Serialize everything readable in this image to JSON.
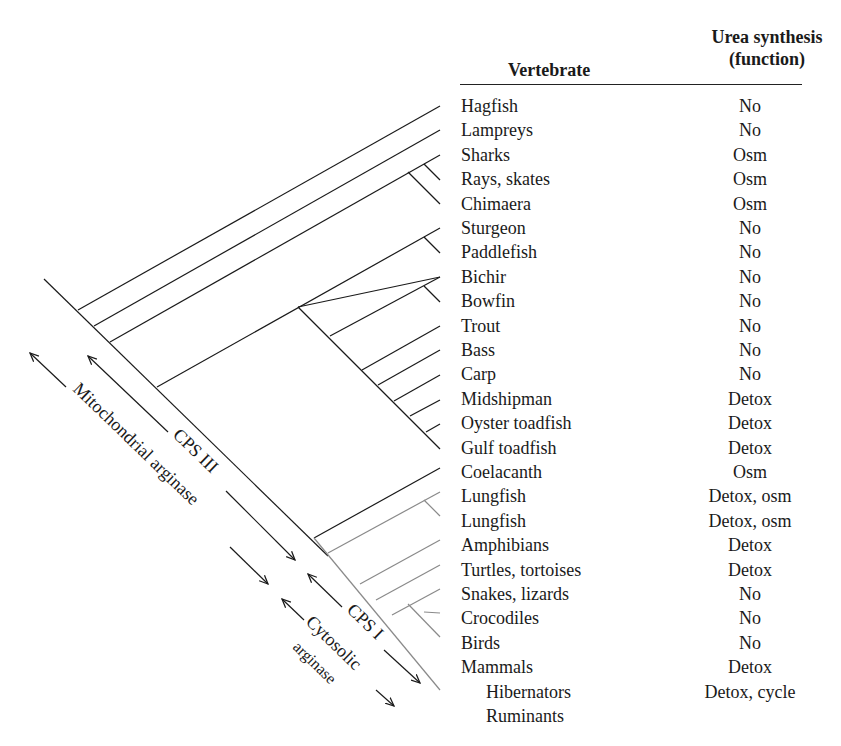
{
  "table": {
    "header": {
      "vertebrate": "Vertebrate",
      "function_line1": "Urea synthesis",
      "function_line2": "(function)"
    },
    "rows": [
      {
        "name": "Hagfish",
        "function": "No"
      },
      {
        "name": "Lampreys",
        "function": "No"
      },
      {
        "name": "Sharks",
        "function": "Osm"
      },
      {
        "name": "Rays, skates",
        "function": "Osm"
      },
      {
        "name": "Chimaera",
        "function": "Osm"
      },
      {
        "name": "Sturgeon",
        "function": "No"
      },
      {
        "name": "Paddlefish",
        "function": "No"
      },
      {
        "name": "Bichir",
        "function": "No"
      },
      {
        "name": "Bowfin",
        "function": "No"
      },
      {
        "name": "Trout",
        "function": "No"
      },
      {
        "name": "Bass",
        "function": "No"
      },
      {
        "name": "Carp",
        "function": "No"
      },
      {
        "name": "Midshipman",
        "function": "Detox"
      },
      {
        "name": "Oyster toadfish",
        "function": "Detox"
      },
      {
        "name": "Gulf toadfish",
        "function": "Detox"
      },
      {
        "name": "Coelacanth",
        "function": "Osm"
      },
      {
        "name": "Lungfish",
        "function": "Detox, osm"
      },
      {
        "name": "Lungfish",
        "function": "Detox, osm"
      },
      {
        "name": "Amphibians",
        "function": "Detox"
      },
      {
        "name": "Turtles, tortoises",
        "function": "Detox"
      },
      {
        "name": "Snakes, lizards",
        "function": "No"
      },
      {
        "name": "Crocodiles",
        "function": "No"
      },
      {
        "name": "Birds",
        "function": "No"
      },
      {
        "name": "Mammals",
        "function": "Detox"
      },
      {
        "name": "Hibernators",
        "function": "Detox, cycle",
        "indent": true
      },
      {
        "name": "Ruminants",
        "function": "",
        "indent": true
      }
    ]
  },
  "annotations": {
    "mito_arginase": "Mitochondrial arginase",
    "cps3": "CPS III",
    "cps1": "CPS I",
    "cyto_line1": "Cytosolic",
    "cyto_line2": "arginase"
  },
  "colors": {
    "line_dark": "#1a1a1a",
    "line_gray": "#8a8a8a"
  }
}
